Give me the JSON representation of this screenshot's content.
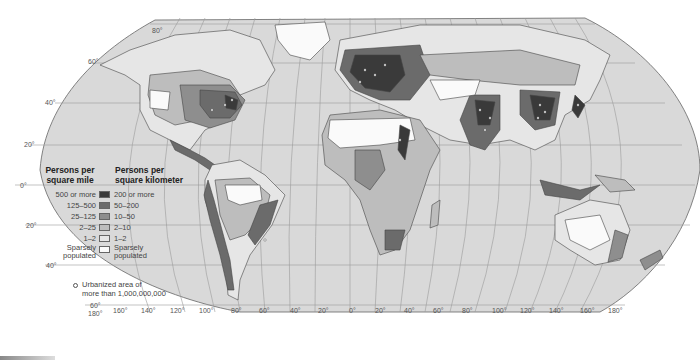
{
  "map": {
    "title": "World population density",
    "projection": "Robinson",
    "colors": {
      "ocean": "#d9d9d9",
      "grid": "#9a9a9a",
      "border": "#555555",
      "class_200_plus": "#3a3a3a",
      "class_50_200": "#6b6b6b",
      "class_10_50": "#8e8e8e",
      "class_2_10": "#bdbdbd",
      "class_1_2": "#e6e6e6",
      "class_sparse": "#fafafa"
    },
    "latitude_labels": [
      "80°",
      "60°",
      "40°",
      "20°",
      "0°",
      "20°",
      "40°",
      "60°"
    ],
    "longitude_labels": [
      "180°",
      "160°",
      "140°",
      "120°",
      "100°",
      "80°",
      "60°",
      "40°",
      "20°",
      "0°",
      "20°",
      "40°",
      "60°",
      "80°",
      "100°",
      "120°",
      "140°",
      "160°",
      "180°"
    ]
  },
  "legend": {
    "heading_left": "Persons per square mile",
    "heading_left_line1": "Persons per",
    "heading_left_line2": "square mile",
    "heading_right_line1": "Persons per",
    "heading_right_line2": "square kilometer",
    "rows": [
      {
        "mile": "500 or more",
        "km": "200 or more",
        "color": "#3a3a3a"
      },
      {
        "mile": "125–500",
        "km": "50–200",
        "color": "#6b6b6b"
      },
      {
        "mile": "25–125",
        "km": "10–50",
        "color": "#8e8e8e"
      },
      {
        "mile": "2–25",
        "km": "2–10",
        "color": "#bdbdbd"
      },
      {
        "mile": "1–2",
        "km": "1–2",
        "color": "#e6e6e6"
      },
      {
        "mile_line1": "Sparsely",
        "mile_line2": "populated",
        "km_line1": "Sparsely",
        "km_line2": "populated",
        "color": "#fafafa"
      }
    ],
    "urban_line1": "Urbanized area of",
    "urban_line2": "more than 1,000,000,000"
  }
}
